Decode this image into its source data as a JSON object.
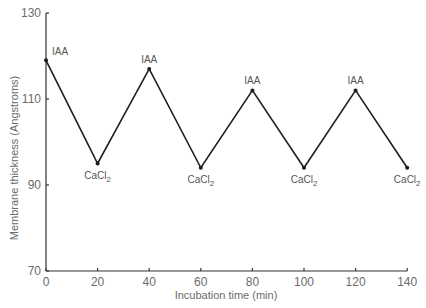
{
  "chart_data": {
    "type": "line",
    "title": "",
    "xlabel": "Incubation time (min)",
    "ylabel": "Membrane thickness (Angstroms)",
    "xlim": [
      0,
      140
    ],
    "ylim": [
      70,
      130
    ],
    "x_ticks": [
      0,
      20,
      40,
      60,
      80,
      100,
      120,
      140
    ],
    "y_ticks": [
      70,
      90,
      110,
      130
    ],
    "grid": false,
    "legend": null,
    "series": [
      {
        "name": "Membrane thickness",
        "x": [
          0,
          20,
          40,
          60,
          80,
          100,
          120,
          140
        ],
        "values": [
          119,
          95,
          117,
          94,
          112,
          94,
          112,
          94
        ],
        "color": "#1e1e1e"
      }
    ],
    "annotations": [
      {
        "x": 0,
        "label": "IAA",
        "position": "above-right"
      },
      {
        "x": 20,
        "label": "CaCl",
        "subscript": "2",
        "position": "below"
      },
      {
        "x": 40,
        "label": "IAA",
        "position": "above"
      },
      {
        "x": 60,
        "label": "CaCl",
        "subscript": "2",
        "position": "below"
      },
      {
        "x": 80,
        "label": "IAA",
        "position": "above"
      },
      {
        "x": 100,
        "label": "CaCl",
        "subscript": "2",
        "position": "below"
      },
      {
        "x": 120,
        "label": "IAA",
        "position": "above"
      },
      {
        "x": 140,
        "label": "CaCl",
        "subscript": "2",
        "position": "below"
      }
    ]
  },
  "layout": {
    "x0_px": 46,
    "x_px_per_unit": 2.58,
    "y0_px": 271,
    "y_px_per_unit": 4.3
  }
}
